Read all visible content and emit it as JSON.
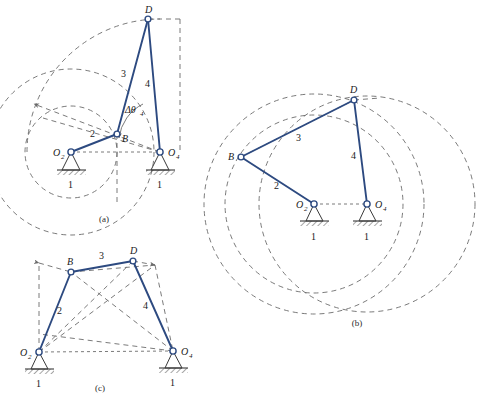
{
  "figure": {
    "colors": {
      "link": "#2d4a80",
      "construction": "#6b6b6b",
      "ground": "#3a3a3a",
      "text": "#1a1a1a",
      "background": "#ffffff"
    },
    "captions": {
      "a": "(a)",
      "b": "(b)",
      "c": "(c)"
    },
    "labels": {
      "O2": "O",
      "O2_sub": "2",
      "O4": "O",
      "O4_sub": "4",
      "B": "B",
      "D": "D",
      "link1": "1",
      "link2": "2",
      "link3": "3",
      "link4": "4",
      "delta_theta4": "Δθ",
      "delta_theta4_sub": "4"
    },
    "panels": [
      {
        "id": "a",
        "caption": "(a)",
        "ground_pivots": [
          {
            "name": "O2",
            "label": "O",
            "sub": "2",
            "x": 71,
            "y": 152
          },
          {
            "name": "O4",
            "label": "O",
            "sub": "4",
            "x": 160,
            "y": 152
          }
        ],
        "joints": [
          {
            "name": "B",
            "label": "B",
            "x": 117,
            "y": 134
          },
          {
            "name": "D",
            "label": "D",
            "x": 148,
            "y": 19
          }
        ],
        "links": [
          {
            "name": "link2",
            "label": "2",
            "from": "O2",
            "to": "B",
            "label_x": 93,
            "label_y": 134
          },
          {
            "name": "link3",
            "label": "3",
            "from": "B",
            "to": "D",
            "label_x": 125,
            "label_y": 73
          },
          {
            "name": "link4",
            "label": "4",
            "from": "D",
            "to": "O4",
            "label_x": 148,
            "label_y": 83
          },
          {
            "name": "link1",
            "label": "1",
            "from": "O2",
            "to": "O4",
            "label_x": 71,
            "label_y": 180
          },
          {
            "name": "link1b",
            "label": "1",
            "from": "O4",
            "to": "O2",
            "label_x": 160,
            "label_y": 180
          }
        ],
        "angle_marker": {
          "name": "delta-theta-4",
          "label": "Δθ",
          "sub": "4",
          "label_x": 130,
          "label_y": 113
        }
      },
      {
        "id": "b",
        "caption": "(b)",
        "ground_pivots": [
          {
            "name": "O2",
            "label": "O",
            "sub": "2",
            "x": 314,
            "y": 204
          },
          {
            "name": "O4",
            "label": "O",
            "sub": "4",
            "x": 367,
            "y": 204
          }
        ],
        "joints": [
          {
            "name": "B",
            "label": "B",
            "x": 241,
            "y": 157
          },
          {
            "name": "D",
            "label": "D",
            "x": 354,
            "y": 100
          }
        ],
        "links": [
          {
            "name": "link2",
            "label": "2",
            "from": "O2",
            "to": "B",
            "label_x": 277,
            "label_y": 185
          },
          {
            "name": "link3",
            "label": "3",
            "from": "B",
            "to": "D",
            "label_x": 299,
            "label_y": 137
          },
          {
            "name": "link4",
            "label": "4",
            "from": "D",
            "to": "O4",
            "label_x": 354,
            "label_y": 155
          },
          {
            "name": "link1",
            "label": "1",
            "from": "O2",
            "to": "O4",
            "label_x": 314,
            "label_y": 232
          },
          {
            "name": "link1b",
            "label": "1",
            "from": "O4",
            "to": "O2",
            "label_x": 367,
            "label_y": 232
          }
        ]
      },
      {
        "id": "c",
        "caption": "(c)",
        "ground_pivots": [
          {
            "name": "O2",
            "label": "O",
            "sub": "2",
            "x": 39,
            "y": 352
          },
          {
            "name": "O4",
            "label": "O",
            "sub": "4",
            "x": 173,
            "y": 351
          }
        ],
        "joints": [
          {
            "name": "B",
            "label": "B",
            "x": 71,
            "y": 272
          },
          {
            "name": "D",
            "label": "D",
            "x": 133,
            "y": 261
          }
        ],
        "links": [
          {
            "name": "link2",
            "label": "2",
            "from": "O2",
            "to": "B",
            "label_x": 60,
            "label_y": 310
          },
          {
            "name": "link3",
            "label": "3",
            "from": "B",
            "to": "D",
            "label_x": 102,
            "label_y": 256
          },
          {
            "name": "link4",
            "label": "4",
            "from": "D",
            "to": "O4",
            "label_x": 146,
            "label_y": 305
          },
          {
            "name": "link1",
            "label": "1",
            "from": "O2",
            "to": "O4",
            "label_x": 39,
            "label_y": 381
          },
          {
            "name": "link1b",
            "label": "1",
            "from": "O4",
            "to": "O2",
            "label_x": 173,
            "label_y": 381
          }
        ]
      }
    ]
  }
}
